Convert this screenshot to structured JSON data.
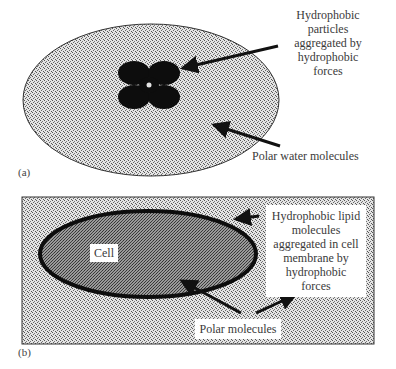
{
  "figure": {
    "panel_a": {
      "tag": "(a)",
      "labels": {
        "hydrophobic_particles": [
          "Hydrophobic",
          "particles",
          "aggregated by",
          "hydrophobic",
          "forces"
        ],
        "polar_water": "Polar water molecules"
      }
    },
    "panel_b": {
      "tag": "(b)",
      "labels": {
        "cell": "Cell",
        "lipid": [
          "Hydrophobic lipid",
          "molecules",
          "aggregated in cell",
          "membrane by",
          "hydrophobic",
          "forces"
        ],
        "polar_molecules": "Polar molecules"
      }
    }
  },
  "colors": {
    "ink": "#111111",
    "light_fill": "#c8c8c8",
    "dark_fill": "#7a7a7a",
    "text": "#3a3a3a"
  }
}
